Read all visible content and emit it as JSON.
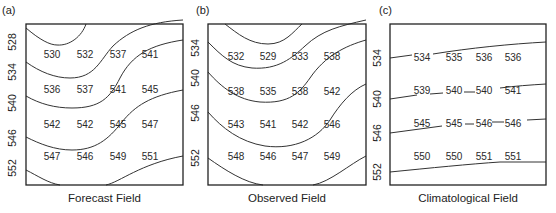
{
  "chart_data": [
    {
      "type": "heatmap",
      "panel_label": "(a)",
      "title": "Forecast Field",
      "xlabel": "Forecast Field",
      "ylabel": "",
      "contour_levels": [
        "528",
        "534",
        "540",
        "546",
        "552"
      ],
      "grid_values": [
        [
          530,
          532,
          537,
          541
        ],
        [
          536,
          537,
          541,
          545
        ],
        [
          542,
          542,
          545,
          547
        ],
        [
          547,
          546,
          549,
          551
        ]
      ]
    },
    {
      "type": "heatmap",
      "panel_label": "(b)",
      "title": "Observed Field",
      "xlabel": "Observed Field",
      "ylabel": "",
      "contour_levels": [
        "534",
        "540",
        "546",
        "552"
      ],
      "grid_values": [
        [
          532,
          529,
          533,
          538
        ],
        [
          538,
          535,
          538,
          542
        ],
        [
          543,
          541,
          542,
          546
        ],
        [
          548,
          546,
          547,
          549
        ]
      ]
    },
    {
      "type": "heatmap",
      "panel_label": "(c)",
      "title": "Climatological Field",
      "xlabel": "Climatological Field",
      "ylabel": "",
      "contour_levels": [
        "534",
        "540",
        "546",
        "552"
      ],
      "grid_values": [
        [
          534,
          535,
          536,
          536
        ],
        [
          539,
          540,
          540,
          541
        ],
        [
          545,
          545,
          546,
          546
        ],
        [
          550,
          550,
          551,
          551
        ]
      ]
    }
  ]
}
